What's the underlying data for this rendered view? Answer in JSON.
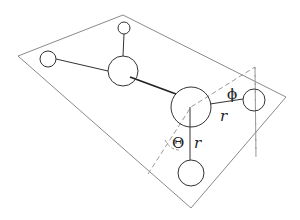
{
  "diagram": {
    "type": "molecular-geometry",
    "colors": {
      "plane_edge": "#8a8a8a",
      "atom_stroke": "#333333",
      "bond": "#333333",
      "dashed_plane": "#999999"
    },
    "plane": {
      "points": "18,56 123,15 286,97 191,208"
    },
    "atoms": [
      {
        "id": "atom-left",
        "cx": 48,
        "cy": 59,
        "r": 8
      },
      {
        "id": "atom-top",
        "cx": 124,
        "cy": 28,
        "r": 6
      },
      {
        "id": "atom-upper-center",
        "cx": 123,
        "cy": 71,
        "r": 15
      },
      {
        "id": "atom-center",
        "cx": 191,
        "cy": 107,
        "r": 20
      },
      {
        "id": "atom-right",
        "cx": 254,
        "cy": 100,
        "r": 11
      },
      {
        "id": "atom-bottom",
        "cx": 191,
        "cy": 173,
        "r": 13
      }
    ],
    "labels": {
      "phi": "ϕ",
      "r_upper": "r",
      "theta": "Θ",
      "r_lower": "r"
    }
  }
}
